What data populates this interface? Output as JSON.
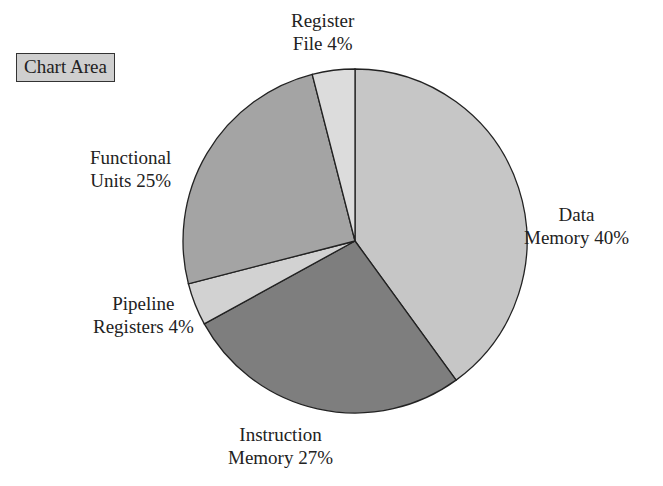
{
  "chart_area_label": "Chart Area",
  "chart_data": {
    "type": "pie",
    "title": "",
    "start_angle_deg": 0,
    "direction": "clockwise",
    "slices": [
      {
        "name": "Data Memory",
        "value": 40,
        "color": "#c6c6c6",
        "label_lines": [
          "Data",
          "Memory 40%"
        ]
      },
      {
        "name": "Instruction Memory",
        "value": 27,
        "color": "#7e7e7e",
        "label_lines": [
          "Instruction",
          "Memory 27%"
        ]
      },
      {
        "name": "Pipeline Registers",
        "value": 4,
        "color": "#d2d2d2",
        "label_lines": [
          "Pipeline",
          "Registers 4%"
        ]
      },
      {
        "name": "Functional Units",
        "value": 25,
        "color": "#a4a4a4",
        "label_lines": [
          "Functional",
          "Units 25%"
        ]
      },
      {
        "name": "Register File",
        "value": 4,
        "color": "#dcdcdc",
        "label_lines": [
          "Register",
          "File 4%"
        ]
      }
    ],
    "categories": [
      "Data Memory",
      "Instruction Memory",
      "Pipeline Registers",
      "Functional Units",
      "Register File"
    ],
    "values": [
      40,
      27,
      4,
      25,
      4
    ],
    "units": "%",
    "legend": "none (data labels on slices)"
  }
}
